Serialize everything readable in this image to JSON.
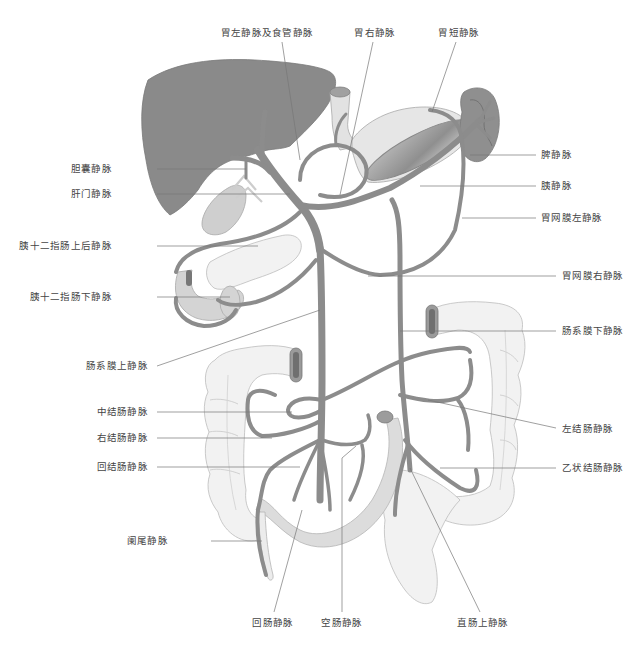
{
  "colors": {
    "liver": "#8a8a8a",
    "vein": "#8c8c8c",
    "vein_edge": "#6e6e6e",
    "organ_light": "#d9d9d9",
    "organ_pale": "#efefef",
    "organ_outline": "#b0b0b0",
    "leader_line": "#777777",
    "text": "#444444"
  },
  "labels": {
    "top": [
      {
        "id": "left_gastric",
        "text": "胃左静脉及食管静脉",
        "x": 267,
        "y": 27
      },
      {
        "id": "right_gastric",
        "text": "胃右静脉",
        "x": 375,
        "y": 27
      },
      {
        "id": "short_gastric",
        "text": "胃短静脉",
        "x": 459,
        "y": 27
      }
    ],
    "left": [
      {
        "id": "cystic",
        "text": "胆囊静脉",
        "x": 112,
        "y": 163
      },
      {
        "id": "portal",
        "text": "肝门静脉",
        "x": 112,
        "y": 188
      },
      {
        "id": "posterior_sup_pancreaticoduodenal",
        "text": "胰十二指肠上后静脉",
        "x": 112,
        "y": 240
      },
      {
        "id": "inferior_pancreaticoduodenal",
        "text": "胰十二指肠下静脉",
        "x": 112,
        "y": 291
      },
      {
        "id": "superior_mesenteric",
        "text": "肠系膜上静脉",
        "x": 148,
        "y": 360
      },
      {
        "id": "middle_colic",
        "text": "中结肠静脉",
        "x": 148,
        "y": 407
      },
      {
        "id": "right_colic",
        "text": "右结肠静脉",
        "x": 148,
        "y": 433
      },
      {
        "id": "ileocolic",
        "text": "回结肠静脉",
        "x": 148,
        "y": 462
      },
      {
        "id": "appendicular",
        "text": "阑尾静脉",
        "x": 168,
        "y": 535
      }
    ],
    "right": [
      {
        "id": "splenic",
        "text": "脾静脉",
        "x": 541,
        "y": 149
      },
      {
        "id": "pancreatic",
        "text": "胰静脉",
        "x": 541,
        "y": 180
      },
      {
        "id": "left_gastroepiploic",
        "text": "胃网膜左静脉",
        "x": 541,
        "y": 212
      },
      {
        "id": "right_gastroepiploic",
        "text": "胃网膜右静脉",
        "x": 562,
        "y": 270
      },
      {
        "id": "inferior_mesenteric",
        "text": "肠系膜下静脉",
        "x": 562,
        "y": 325
      },
      {
        "id": "left_colic",
        "text": "左结肠静脉",
        "x": 562,
        "y": 423
      },
      {
        "id": "sigmoid",
        "text": "乙状结肠静脉",
        "x": 562,
        "y": 462
      }
    ],
    "bottom": [
      {
        "id": "ileal",
        "text": "回肠静脉",
        "x": 273,
        "y": 619
      },
      {
        "id": "jejunal",
        "text": "空肠静脉",
        "x": 342,
        "y": 619
      },
      {
        "id": "superior_rectal",
        "text": "直肠上静脉",
        "x": 483,
        "y": 619
      }
    ]
  }
}
